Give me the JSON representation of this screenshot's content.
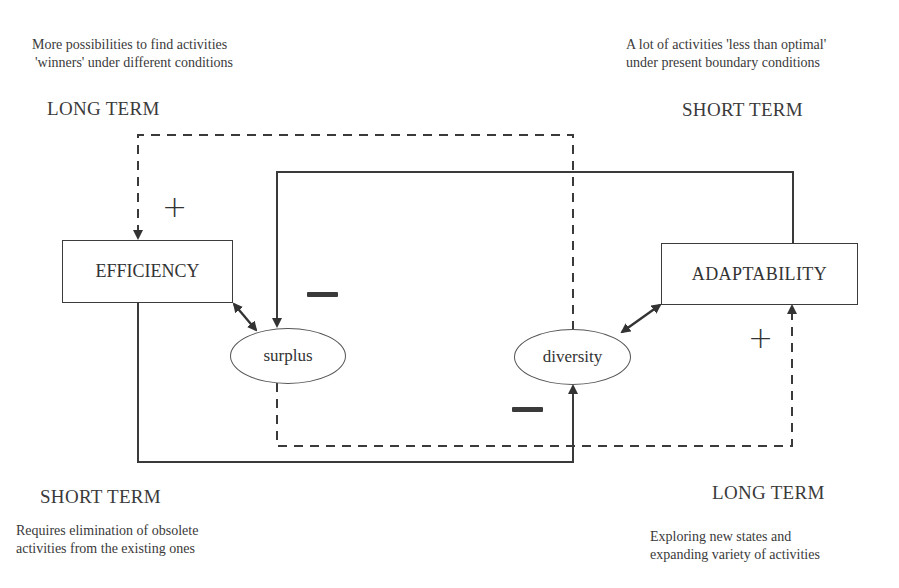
{
  "diagram": {
    "annotations": {
      "top_left": {
        "line1": "More possibilities to find activities",
        "line2": "'winners'  under different conditions"
      },
      "top_right": {
        "line1": "A lot of activities  'less than optimal'",
        "line2": "under present boundary conditions"
      },
      "bottom_left": {
        "line1": "Requires elimination of obsolete",
        "line2": "activities from the existing ones"
      },
      "bottom_right": {
        "line1": "Exploring new states and",
        "line2": "expanding variety of activities"
      }
    },
    "term_labels": {
      "top_left": "LONG TERM",
      "top_right": "SHORT TERM",
      "bottom_left": "SHORT TERM",
      "bottom_right": "LONG TERM"
    },
    "nodes": {
      "efficiency": "EFFICIENCY",
      "adaptability": "ADAPTABILITY",
      "surplus": "surplus",
      "diversity": "diversity"
    },
    "signs": {
      "efficiency_input": "+",
      "surplus_input": "−",
      "diversity_input": "−",
      "adaptability_input": "+"
    },
    "edges": [
      {
        "from": "diversity",
        "to": "efficiency",
        "style": "dashed",
        "sign": "+",
        "term": "LONG TERM"
      },
      {
        "from": "adaptability",
        "to": "surplus",
        "style": "solid",
        "sign": "−",
        "term": "SHORT TERM"
      },
      {
        "from": "efficiency",
        "to": "diversity",
        "style": "solid",
        "sign": "−",
        "term": "SHORT TERM"
      },
      {
        "from": "surplus",
        "to": "adaptability",
        "style": "dashed",
        "sign": "+",
        "term": "LONG TERM"
      },
      {
        "from": "efficiency",
        "to": "surplus",
        "style": "solid",
        "bidirectional": true
      },
      {
        "from": "adaptability",
        "to": "diversity",
        "style": "solid",
        "bidirectional": true
      }
    ],
    "colors": {
      "line": "#333333",
      "text": "#333333",
      "background": "#ffffff"
    }
  }
}
